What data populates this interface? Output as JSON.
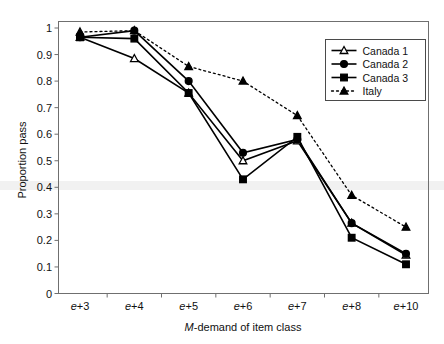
{
  "chart_data": {
    "type": "line",
    "title": "",
    "xlabel": "M-demand of item class",
    "xlabel_italic_prefix": "M",
    "xlabel_rest": "-demand of item class",
    "ylabel": "Proportion pass",
    "categories": [
      "e+3",
      "e+4",
      "e+5",
      "e+6",
      "e+7",
      "e+8",
      "e+10"
    ],
    "ylim": [
      0,
      1
    ],
    "yticks": [
      "0",
      "0.1",
      "0.2",
      "0.3",
      "0.4",
      "0.5",
      "0.6",
      "0.7",
      "0.8",
      "0.9",
      "1"
    ],
    "ytick_values": [
      0,
      0.1,
      0.2,
      0.3,
      0.4,
      0.5,
      0.6,
      0.7,
      0.8,
      0.9,
      1
    ],
    "grid": false,
    "legend_position": "top-right",
    "series": [
      {
        "name": "Canada 1",
        "marker": "open-triangle",
        "line": "solid",
        "values": [
          0.965,
          0.885,
          0.755,
          0.5,
          0.575,
          0.265,
          0.145
        ]
      },
      {
        "name": "Canada 2",
        "marker": "filled-circle",
        "line": "solid",
        "values": [
          0.965,
          0.99,
          0.8,
          0.53,
          0.58,
          0.265,
          0.15
        ]
      },
      {
        "name": "Canada 3",
        "marker": "filled-square",
        "line": "solid",
        "values": [
          0.965,
          0.96,
          0.755,
          0.43,
          0.59,
          0.21,
          0.11
        ]
      },
      {
        "name": "Italy",
        "marker": "filled-triangle",
        "line": "dotted",
        "values": [
          0.985,
          0.99,
          0.855,
          0.8,
          0.67,
          0.37,
          0.25
        ]
      }
    ]
  },
  "legend": {
    "entries": [
      {
        "label": "Canada 1"
      },
      {
        "label": "Canada 2"
      },
      {
        "label": "Canada 3"
      },
      {
        "label": "Italy"
      }
    ]
  },
  "colors": {
    "series": "#000000",
    "frame": "#6f6f6f",
    "background": "#ffffff"
  }
}
